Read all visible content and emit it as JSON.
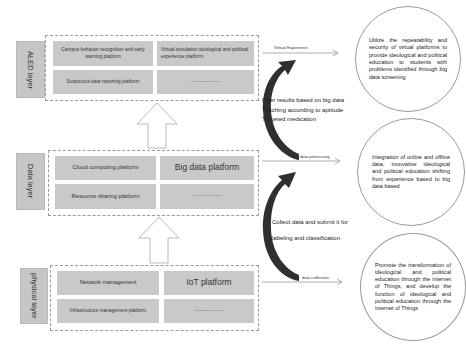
{
  "layers": [
    {
      "id": "aled",
      "label": "ALED layer",
      "cells": [
        {
          "text": "Campus behavior recognition and early warning platform"
        },
        {
          "text": "Virtual simulation ideological and political experience platform"
        },
        {
          "text": "Suspicious data reporting platform"
        },
        {
          "text": "——————"
        }
      ],
      "flow_label": "Virtual Experience",
      "outcome": "Utilize the repeatability and security of virtual platforms to provide ideological and political education to students with problems identified through big data screening"
    },
    {
      "id": "data",
      "label": "Data layer",
      "cells": [
        {
          "text": "Cloud computing platform"
        },
        {
          "text": "Big data platform"
        },
        {
          "text": "Resource sharing platform"
        },
        {
          "text": "——————"
        }
      ],
      "flow_label": "data processing",
      "outcome": "Integration of online and offline data, innovative ideological and political education shifting from experience based to big data based"
    },
    {
      "id": "physical",
      "label": "physical layer",
      "cells": [
        {
          "text": "Network management"
        },
        {
          "text": "IoT platform"
        },
        {
          "text": "Infrastructure management platform"
        },
        {
          "text": "——————"
        }
      ],
      "flow_label": "data collection",
      "outcome": "Promote the transformation of ideological and political education through the internet of Things, and develop the function of ideological and political education through the internet of Things"
    }
  ],
  "transitions": {
    "data_to_aled": [
      "Filter results based on big data",
      "Teaching according to aptitude",
      "Targeted medication"
    ],
    "physical_to_data": [
      "Collect data and submit it for",
      "labeling and classification"
    ]
  },
  "colors": {
    "cell_fill": "#c9c9c9",
    "label_fill": "#c6c6c6",
    "curved_arrow": "#2f2f2f",
    "line": "#9a9a9a"
  }
}
